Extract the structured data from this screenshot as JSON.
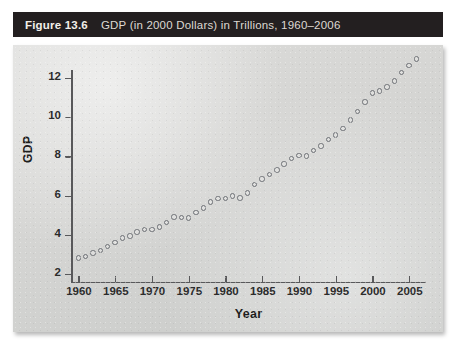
{
  "figure": {
    "label": "Figure 13.6",
    "title": "GDP (in 2000 Dollars) in Trillions, 1960–2006"
  },
  "colors": {
    "title_bar_bg": "#231f20",
    "title_text": "#e8e4de",
    "panel_bg": "#d6d6d4",
    "axis": "#58585a",
    "marker_edge": "#6e7176"
  },
  "chart_data": {
    "type": "scatter",
    "title": "GDP (in 2000 Dollars) in Trillions, 1960–2006",
    "xlabel": "Year",
    "ylabel": "GDP",
    "xlim": [
      1959,
      2007
    ],
    "ylim": [
      1.6,
      12.4
    ],
    "xticks": [
      1960,
      1965,
      1970,
      1975,
      1980,
      1985,
      1990,
      1995,
      2000,
      2005
    ],
    "yticks": [
      2,
      4,
      6,
      8,
      10,
      12
    ],
    "grid": false,
    "legend": false,
    "marker": "open-circle",
    "series": [
      {
        "name": "GDP",
        "x": [
          1960,
          1961,
          1962,
          1963,
          1964,
          1965,
          1966,
          1967,
          1968,
          1969,
          1970,
          1971,
          1972,
          1973,
          1974,
          1975,
          1976,
          1977,
          1978,
          1979,
          1980,
          1981,
          1982,
          1983,
          1984,
          1985,
          1986,
          1987,
          1988,
          1989,
          1990,
          1991,
          1992,
          1993,
          1994,
          1995,
          1996,
          1997,
          1998,
          1999,
          2000,
          2001,
          2002,
          2003,
          2004,
          2005,
          2006
        ],
        "y": [
          2.83,
          2.9,
          3.08,
          3.21,
          3.4,
          3.61,
          3.85,
          3.95,
          4.14,
          4.27,
          4.27,
          4.41,
          4.64,
          4.91,
          4.88,
          4.87,
          5.13,
          5.37,
          5.67,
          5.85,
          5.84,
          5.99,
          5.87,
          6.14,
          6.58,
          6.85,
          7.09,
          7.31,
          7.61,
          7.89,
          8.03,
          8.01,
          8.29,
          8.52,
          8.87,
          9.09,
          9.43,
          9.85,
          10.28,
          10.78,
          11.22,
          11.33,
          11.54,
          11.84,
          12.26,
          12.62,
          12.96
        ]
      }
    ]
  },
  "axis_render": {
    "y_plot_top_value": 12.4,
    "y_plot_bottom_value": 1.6,
    "x_plot_left_value": 1959,
    "x_plot_right_value": 2007.3
  }
}
